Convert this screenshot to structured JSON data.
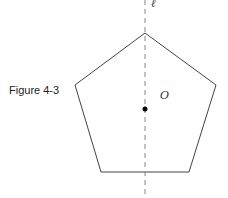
{
  "figure": {
    "caption": "Figure 4-3",
    "center_label": "O",
    "axis_label": "ℓ",
    "shape": "regular pentagon",
    "vertices": [
      [
        145,
        33
      ],
      [
        216,
        85
      ],
      [
        189,
        172
      ],
      [
        101,
        172
      ],
      [
        75,
        85
      ]
    ],
    "center_point": [
      145,
      109
    ],
    "symmetry_line": {
      "x": 145,
      "y1": 0,
      "y2": 198,
      "style": "dashed"
    },
    "colors": {
      "stroke": "#444444",
      "dash": "#888888",
      "point": "#000000"
    }
  }
}
